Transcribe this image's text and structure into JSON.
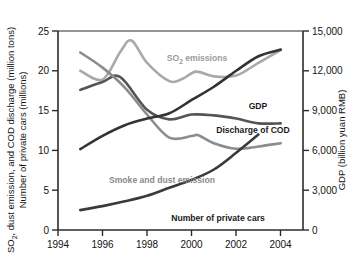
{
  "chart_data": {
    "type": "line",
    "title": "",
    "xlabel": "",
    "ylabel": "SO₂, dust emission, and COD discharge (million tons)\nNumber of private cars (millions)",
    "ylabel_line1_pre": "SO",
    "ylabel_line1_sub": "2",
    "ylabel_line1_post": ", dust emission, and COD discharge (million tons)",
    "ylabel_line2": "Number of private cars (millions)",
    "y2label": "GDP (billion yuan RMB)",
    "x": [
      1995,
      1996,
      1997,
      1998,
      1999,
      2000,
      2001,
      2002,
      2003,
      2004
    ],
    "xlim": [
      1994,
      2005
    ],
    "xticks": [
      1994,
      1996,
      1998,
      2000,
      2002,
      2004
    ],
    "xticklabels": [
      "1994",
      "1996",
      "1998",
      "2000",
      "2002",
      "2004"
    ],
    "ylim": [
      0,
      25
    ],
    "yticks": [
      0,
      5,
      10,
      15,
      20,
      25
    ],
    "yticklabels": [
      "0",
      "5",
      "10",
      "15",
      "20",
      "25"
    ],
    "y2lim": [
      0,
      15000
    ],
    "y2ticks": [
      0,
      3000,
      6000,
      9000,
      12000,
      15000
    ],
    "y2ticklabels": [
      "0",
      "3,000",
      "6,000",
      "9,000",
      "12,000",
      "15,000"
    ],
    "grid": false,
    "legend": "inline-annotations",
    "series": [
      {
        "name": "SO₂ emissions",
        "label": "SO2 emissions",
        "label_pre": "SO",
        "label_sub": "2",
        "label_post": " emissions",
        "axis": "left",
        "color": "#a9a9a9",
        "x": [
          1995,
          1996,
          1996.8,
          1997.3,
          1998,
          1999,
          1999.6,
          2000.2,
          2001,
          2002,
          2003,
          2004
        ],
        "values": [
          20.0,
          18.9,
          22.4,
          23.8,
          21.0,
          18.7,
          19.0,
          19.9,
          19.3,
          19.4,
          21.0,
          22.6
        ]
      },
      {
        "name": "Discharge of COD",
        "label": "Discharge of COD",
        "axis": "left",
        "color": "#555555",
        "x": [
          1995,
          1996,
          1996.8,
          1998,
          1999,
          2000,
          2001,
          2002,
          2003,
          2004
        ],
        "values": [
          17.6,
          18.6,
          19.2,
          15.1,
          13.9,
          14.5,
          14.4,
          14.0,
          13.4,
          13.4
        ]
      },
      {
        "name": "Smoke and dust emission",
        "label": "Smoke and dust emission",
        "axis": "left",
        "color": "#8c8c8c",
        "x": [
          1995,
          1996,
          1997,
          1998,
          1999,
          2000,
          2000.3,
          2001,
          2002,
          2003,
          2004
        ],
        "values": [
          22.3,
          20.4,
          17.9,
          14.5,
          11.6,
          11.8,
          11.9,
          10.9,
          10.2,
          10.5,
          10.9
        ]
      },
      {
        "name": "GDP",
        "label": "GDP",
        "axis": "right",
        "color": "#333333",
        "x": [
          1995,
          1996,
          1997,
          1998,
          1999,
          2000,
          2001,
          2002,
          2003,
          2004
        ],
        "values": [
          6100,
          7100,
          7900,
          8400,
          8800,
          9800,
          10800,
          12000,
          13100,
          13600
        ]
      },
      {
        "name": "Number of private cars",
        "label": "Number of private cars",
        "axis": "left",
        "color": "#3a3a3a",
        "x": [
          1995,
          1996,
          1997,
          1998,
          1999,
          2000,
          2001,
          2002,
          2003
        ],
        "values": [
          2.5,
          3.0,
          3.6,
          4.3,
          5.3,
          6.3,
          7.6,
          9.7,
          12.0
        ]
      }
    ],
    "annotations": [
      {
        "name": "so2-label",
        "text": "SO2 emissions",
        "x_px": 197,
        "y_px": 61,
        "color": "#9a9a9a",
        "anchor": "middle"
      },
      {
        "name": "gdp-label",
        "text": "GDP",
        "x_px": 258,
        "y_px": 109,
        "color": "#1a1a1a",
        "anchor": "middle"
      },
      {
        "name": "cod-label",
        "text": "Discharge of COD",
        "x_px": 253,
        "y_px": 133,
        "color": "#1a1a1a",
        "anchor": "middle"
      },
      {
        "name": "smoke-label",
        "text": "Smoke and dust emission",
        "x_px": 162,
        "y_px": 183,
        "color": "#8a8a8a",
        "anchor": "middle"
      },
      {
        "name": "cars-label",
        "text": "Number of private cars",
        "x_px": 218,
        "y_px": 221,
        "color": "#1a1a1a",
        "anchor": "middle"
      }
    ],
    "colors": {
      "so2": "#a9a9a9",
      "cod": "#555555",
      "smoke": "#8c8c8c",
      "gdp": "#333333",
      "cars": "#3a3a3a",
      "axis": "#2b2b2b",
      "background": "#ffffff"
    }
  }
}
